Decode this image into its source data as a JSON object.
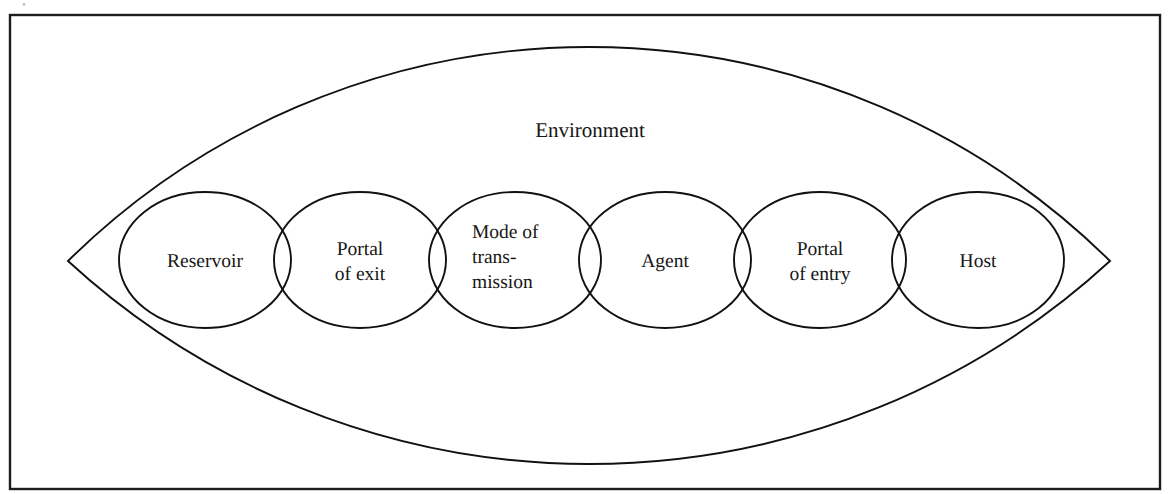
{
  "figure": {
    "frame": {
      "x": 10,
      "y": 15,
      "width": 1150,
      "height": 474,
      "stroke_color": "#1d1d1d"
    },
    "background_color": "#ffffff",
    "stroke_color": "#111111",
    "text_color": "#161616",
    "artifact_glyph": "•"
  },
  "environment": {
    "label": "Environment",
    "label_x": 590,
    "label_y": 137,
    "shape": "lens",
    "left_vertex": {
      "x": 68,
      "y": 261
    },
    "right_vertex": {
      "x": 1110,
      "y": 261
    },
    "top_apex": {
      "x": 590,
      "y": 47
    },
    "bottom_apex": {
      "x": 590,
      "y": 464
    }
  },
  "chain": {
    "ellipse_rx": 86,
    "ellipse_ry": 68,
    "ellipse_cy": 260,
    "nodes": [
      {
        "id": "reservoir",
        "cx": 205,
        "lines": [
          "Reservoir"
        ],
        "text_anchor": "middle",
        "text_x": 205,
        "first_line_y": 267
      },
      {
        "id": "portal-of-exit",
        "cx": 360,
        "lines": [
          "Portal",
          "of exit"
        ],
        "text_anchor": "middle",
        "text_x": 360,
        "first_line_y": 255
      },
      {
        "id": "mode-of-transmission",
        "cx": 515,
        "lines": [
          "Mode of",
          "trans-",
          "mission"
        ],
        "text_anchor": "start",
        "text_x": 472,
        "first_line_y": 238
      },
      {
        "id": "agent",
        "cx": 665,
        "lines": [
          "Agent"
        ],
        "text_anchor": "middle",
        "text_x": 665,
        "first_line_y": 267
      },
      {
        "id": "portal-of-entry",
        "cx": 820,
        "lines": [
          "Portal",
          "of entry"
        ],
        "text_anchor": "middle",
        "text_x": 820,
        "first_line_y": 255
      },
      {
        "id": "host",
        "cx": 978,
        "lines": [
          "Host"
        ],
        "text_anchor": "middle",
        "text_x": 978,
        "first_line_y": 267
      }
    ]
  }
}
